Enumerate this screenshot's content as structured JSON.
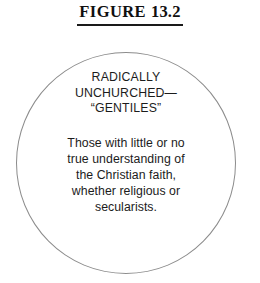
{
  "figure": {
    "label": "FIGURE",
    "number": "13.2"
  },
  "diagram": {
    "shape": "circle",
    "stroke_color": "#8c8c8c",
    "fill_color": "#ffffff",
    "text_color": "#1c1c1c",
    "heading": {
      "lines": [
        "RADICALLY",
        "UNCHURCHED—",
        "“GENTILES”"
      ]
    },
    "body": {
      "lines": [
        "Those with little or no",
        "true understanding of",
        "the Christian faith,",
        "whether religious or",
        "secularists."
      ]
    }
  }
}
